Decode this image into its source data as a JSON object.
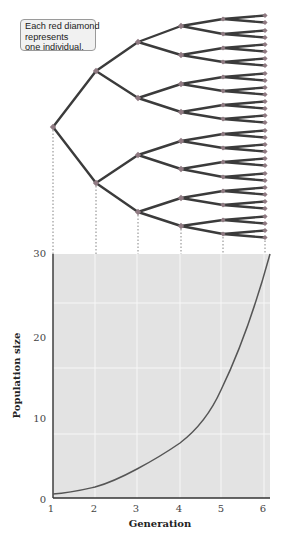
{
  "callout": {
    "lines": [
      "Each red diamond",
      "represents",
      "one individual."
    ]
  },
  "colors": {
    "plot_bg": "#e3e3e3",
    "gridline": "#f7f7f7",
    "branch": "#3b3b3b",
    "diamond": "#8f7a82",
    "curve": "#555555",
    "axis": "#333333",
    "dotted": "#666666"
  },
  "tree": {
    "generation_x": [
      53,
      96,
      138,
      181,
      223,
      265
    ],
    "generation_y": [
      [
        127
      ],
      [
        71,
        183
      ],
      [
        42,
        98,
        155,
        212
      ],
      [
        26,
        55,
        84,
        112,
        141,
        169,
        198,
        226
      ],
      [
        19,
        34,
        48,
        62,
        77,
        91,
        105,
        119,
        134,
        148,
        162,
        177,
        191,
        205,
        220,
        234
      ],
      [
        15.5,
        22.5,
        30.5,
        37.5,
        44.5,
        51.5,
        58.5,
        65.5,
        73.5,
        80.5,
        87.5,
        94.5,
        101.5,
        108.5,
        115.5,
        122.5,
        130.5,
        137.5,
        144.5,
        151.5,
        158.5,
        165.5,
        173.5,
        180.5,
        187.5,
        194.5,
        201.5,
        208.5,
        216.5,
        223.5,
        230.5,
        237.5
      ]
    ]
  },
  "chart_data": {
    "type": "line",
    "title": "",
    "xlabel": "Generation",
    "ylabel": "Population size",
    "x_ticks": [
      "1",
      "2",
      "3",
      "4",
      "5",
      "6"
    ],
    "y_ticks": [
      "0",
      "10",
      "20",
      "30"
    ],
    "xlim": [
      1,
      6.15
    ],
    "ylim": [
      0,
      30
    ],
    "grid": true,
    "series": [
      {
        "name": "Population size",
        "x": [
          1,
          2,
          3,
          4,
          5,
          6.15
        ],
        "y": [
          0.5,
          1.4,
          3.6,
          6.9,
          13.3,
          30
        ]
      }
    ]
  },
  "axes": {
    "y_tick_labels": [
      "30",
      "20",
      "10",
      "0"
    ],
    "x_tick_labels": [
      "1",
      "2",
      "3",
      "4",
      "5",
      "6"
    ],
    "xlabel": "Generation",
    "ylabel": "Population size"
  }
}
